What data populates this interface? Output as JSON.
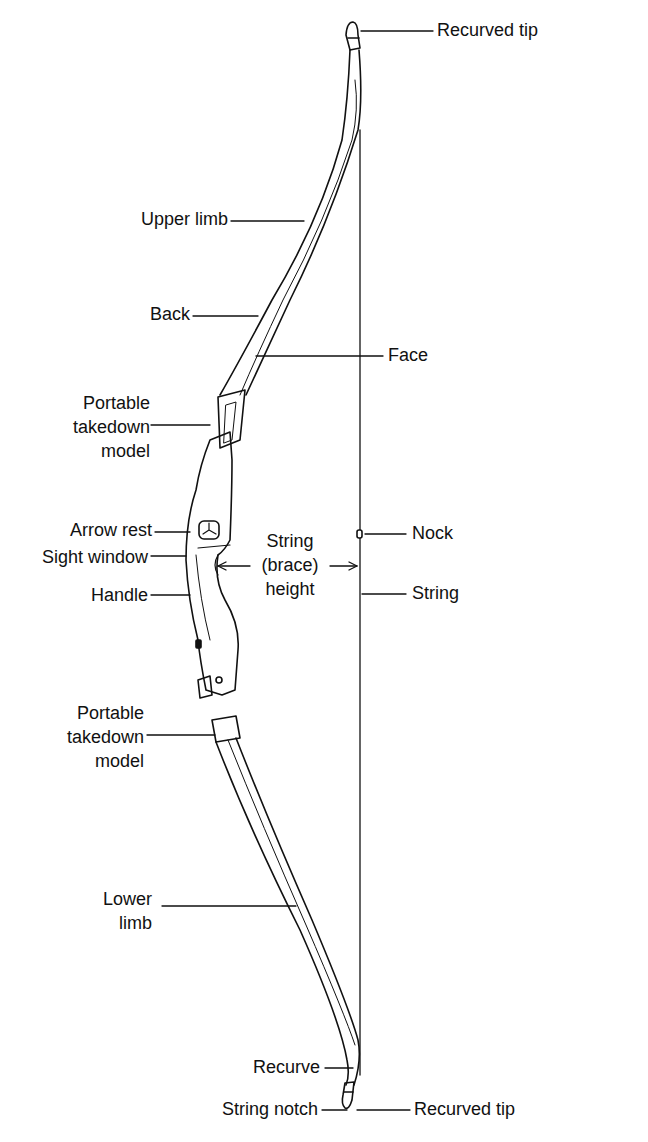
{
  "diagram": {
    "labels": {
      "recurved_tip_top": "Recurved tip",
      "upper_limb": "Upper limb",
      "back": "Back",
      "face": "Face",
      "takedown_upper": "Portable\ntakedown\nmodel",
      "arrow_rest": "Arrow rest",
      "sight_window": "Sight window",
      "handle": "Handle",
      "brace_height": "String\n(brace)\nheight",
      "nock": "Nock",
      "string": "String",
      "takedown_lower": "Portable\ntakedown\nmodel",
      "lower_limb": "Lower\nlimb",
      "recurve": "Recurve",
      "string_notch": "String notch",
      "recurved_tip_bottom": "Recurved tip"
    },
    "colors": {
      "ink": "#111111",
      "background": "#ffffff"
    }
  }
}
